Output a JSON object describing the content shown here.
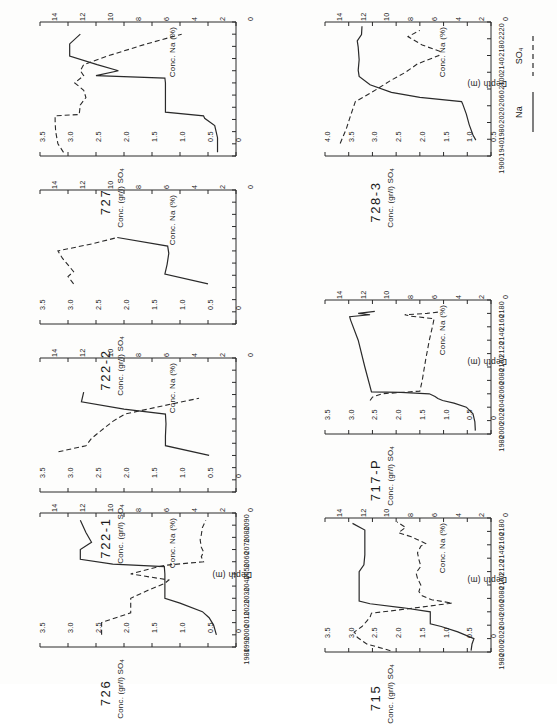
{
  "figure": {
    "orientation": "rotated-90",
    "y_axis_title": "Conc. (gr/l) SO4",
    "y_axis_title_sub": "4",
    "y_axis_title_main": "Conc. (gr/l) SO",
    "y2_axis_title": "Conc. Na (%)",
    "x_axis_title": "Depth (m)"
  },
  "legend": {
    "position": "right-of-728-3",
    "items": [
      {
        "label": "SO4",
        "label_main": "SO",
        "label_sub": "4",
        "style": "dashed",
        "name": "sulphate"
      },
      {
        "label": "Na",
        "label_main": "Na",
        "label_sub": "",
        "style": "solid",
        "name": "sodium"
      }
    ]
  },
  "chart_data": [
    {
      "id": "727",
      "type": "line",
      "title": "727",
      "xlabel": "Depth (m)",
      "ylabel": "Conc. (gr/l) SO4",
      "y2label": "Conc. Na (%)",
      "xlim": [
        1980,
        2090
      ],
      "ylim": [
        0,
        3.5
      ],
      "y2lim": [
        0,
        14
      ],
      "xticks": [
        1980,
        1990,
        2000,
        2010,
        2020,
        2030,
        2040,
        2050,
        2060,
        2070,
        2080,
        2090
      ],
      "xticklabels_shown": false,
      "yticks": [
        0,
        0.5,
        1.0,
        1.5,
        2.0,
        2.5,
        3.0,
        3.5
      ],
      "yticklabels": [
        "0",
        "0.5",
        "1.0",
        "1.5",
        "2.0",
        "2.5",
        "3.0",
        "3.5"
      ],
      "y2ticks": [
        0,
        2,
        4,
        6,
        8,
        10,
        12,
        14
      ],
      "y2ticklabels": [
        "0",
        "2",
        "4",
        "6",
        "8",
        "10",
        "12",
        "14"
      ],
      "grid": false,
      "series": [
        {
          "name": "SO4",
          "style": "dashed",
          "x": [
            1983,
            1990,
            2000,
            2008,
            2013,
            2014,
            2022,
            2028,
            2034,
            2040,
            2046,
            2050,
            2055,
            2062,
            2072,
            2080
          ],
          "y": [
            3.08,
            3.18,
            3.22,
            3.23,
            3.23,
            2.8,
            2.78,
            2.68,
            2.72,
            2.88,
            2.72,
            2.78,
            2.72,
            2.3,
            1.6,
            0.97
          ]
        },
        {
          "name": "Na",
          "style": "solid",
          "x": [
            1983,
            1995,
            2005,
            2011,
            2013,
            2016,
            2040,
            2044,
            2046,
            2050,
            2055,
            2062,
            2072,
            2080
          ],
          "y": [
            0.33,
            0.33,
            0.38,
            0.56,
            0.58,
            1.26,
            1.26,
            1.27,
            2.5,
            2.1,
            2.48,
            2.97,
            2.97,
            2.78
          ]
        }
      ]
    },
    {
      "id": "722-2",
      "type": "line",
      "title": "722-2",
      "xlabel": "Depth (m)",
      "ylabel": "Conc. (gr/l) SO4",
      "y2label": "Conc. Na (%)",
      "xlim": [
        1980,
        2090
      ],
      "ylim": [
        0,
        3.5
      ],
      "y2lim": [
        0,
        14
      ],
      "xticks": [
        1980,
        1990,
        2000,
        2010,
        2020,
        2030,
        2040,
        2050,
        2060,
        2070,
        2080,
        2090
      ],
      "xticklabels_shown": false,
      "yticks": [
        0,
        0.5,
        1.0,
        1.5,
        2.0,
        2.5,
        3.0,
        3.5
      ],
      "yticklabels": [
        "0",
        "0.5",
        "1.0",
        "1.5",
        "2.0",
        "2.5",
        "3.0",
        "3.5"
      ],
      "y2ticks": [
        0,
        2,
        4,
        6,
        8,
        10,
        12,
        14
      ],
      "y2ticklabels": [
        "0",
        "2",
        "4",
        "6",
        "8",
        "10",
        "12",
        "14"
      ],
      "grid": false,
      "series": [
        {
          "name": "SO4",
          "style": "dashed",
          "x": [
            2013,
            2019,
            2023,
            2034,
            2040,
            2046,
            2051
          ],
          "y": [
            2.9,
            3.0,
            2.9,
            3.1,
            3.18,
            2.55,
            2.12
          ]
        },
        {
          "name": "Na",
          "style": "solid",
          "x": [
            2013,
            2021,
            2029,
            2038,
            2044,
            2051
          ],
          "y": [
            0.5,
            1.27,
            1.23,
            1.2,
            1.22,
            2.12
          ]
        }
      ]
    },
    {
      "id": "722-1",
      "type": "line",
      "title": "722-1",
      "xlabel": "Depth (m)",
      "ylabel": "Conc. (gr/l) SO4",
      "y2label": "Conc. Na (%)",
      "xlim": [
        1980,
        2090
      ],
      "ylim": [
        0,
        3.5
      ],
      "y2lim": [
        0,
        14
      ],
      "xticks": [
        1980,
        1990,
        2000,
        2010,
        2020,
        2030,
        2040,
        2050,
        2060,
        2070,
        2080,
        2090
      ],
      "xticklabels_shown": false,
      "yticks": [
        0,
        0.5,
        1.0,
        1.5,
        2.0,
        2.5,
        3.0,
        3.5
      ],
      "yticklabels": [
        "0",
        "0.5",
        "1.0",
        "1.5",
        "2.0",
        "2.5",
        "3.0",
        "3.5"
      ],
      "y2ticks": [
        0,
        2,
        4,
        6,
        8,
        10,
        12,
        14
      ],
      "y2ticklabels": [
        "0",
        "2",
        "4",
        "6",
        "8",
        "10",
        "12",
        "14"
      ],
      "grid": false,
      "series": [
        {
          "name": "SO4",
          "style": "dashed",
          "x": [
            2013,
            2018,
            2024,
            2030,
            2038,
            2044,
            2050,
            2057
          ],
          "y": [
            3.17,
            2.68,
            2.58,
            2.42,
            2.2,
            1.98,
            1.38,
            0.66
          ]
        },
        {
          "name": "Na",
          "style": "solid",
          "x": [
            2010,
            2018,
            2026,
            2036,
            2044,
            2048,
            2054,
            2062
          ],
          "y": [
            0.48,
            1.26,
            1.26,
            1.25,
            1.26,
            2.0,
            2.76,
            2.72
          ]
        }
      ]
    },
    {
      "id": "726",
      "type": "line",
      "title": "726",
      "xlabel": "Depth (m)",
      "ylabel": "Conc. (gr/l) SO4",
      "y2label": "Conc. Na (%)",
      "xlim": [
        1980,
        2090
      ],
      "ylim": [
        0,
        3.5
      ],
      "y2lim": [
        0,
        14
      ],
      "xticks": [
        1980,
        1990,
        2000,
        2010,
        2020,
        2030,
        2040,
        2050,
        2060,
        2070,
        2080,
        2090
      ],
      "xticklabels": [
        "1980",
        "1990",
        "2000",
        "2010",
        "2020",
        "2030",
        "2040",
        "2050",
        "2060",
        "2070",
        "2080",
        "2090"
      ],
      "xticklabels_shown": true,
      "yticks": [
        0,
        0.5,
        1.0,
        1.5,
        2.0,
        2.5,
        3.0,
        3.5
      ],
      "yticklabels": [
        "0",
        "0.5",
        "1.0",
        "1.5",
        "2.0",
        "2.5",
        "3.0",
        "3.5"
      ],
      "y2ticks": [
        0,
        2,
        4,
        6,
        8,
        10,
        12,
        14
      ],
      "y2ticklabels": [
        "0",
        "2",
        "4",
        "6",
        "8",
        "10",
        "12",
        "14"
      ],
      "grid": false,
      "series": [
        {
          "name": "SO4",
          "style": "dashed",
          "x": [
            1990,
            2000,
            2002,
            2008,
            2012,
            2020,
            2026,
            2032,
            2035,
            2040,
            2044,
            2047,
            2050,
            2054,
            2058,
            2062,
            2068,
            2072,
            2078,
            2084
          ],
          "y": [
            2.4,
            2.4,
            2.28,
            1.88,
            1.88,
            1.88,
            1.6,
            1.28,
            1.2,
            1.88,
            1.55,
            1.28,
            0.58,
            0.62,
            0.58,
            0.62,
            0.64,
            0.62,
            0.6,
            0.54
          ]
        },
        {
          "name": "Na",
          "style": "solid",
          "x": [
            1990,
            1998,
            2004,
            2009,
            2016,
            2020,
            2030,
            2040,
            2046,
            2048,
            2052,
            2060,
            2066,
            2074,
            2084
          ],
          "y": [
            0.35,
            0.4,
            0.48,
            0.6,
            1.0,
            1.27,
            1.27,
            1.27,
            1.28,
            2.2,
            2.78,
            2.78,
            2.58,
            2.68,
            2.78
          ]
        }
      ]
    },
    {
      "id": "728-3",
      "type": "line",
      "title": "728-3",
      "xlabel": "Depth (m)",
      "ylabel": "Conc. (gr/l) SO4",
      "y2label": "Conc. Na (%)",
      "xlim": [
        1900,
        2220
      ],
      "ylim": [
        0.5,
        4.0
      ],
      "y2lim": [
        0,
        14
      ],
      "xticks": [
        1900,
        1940,
        1980,
        2020,
        2060,
        2100,
        2140,
        2180,
        2220
      ],
      "xticklabels": [
        "1900",
        "1940",
        "1980",
        "2020",
        "2060",
        "2100",
        "2140",
        "2180",
        "2220"
      ],
      "xticklabels_shown": true,
      "yticks": [
        0.5,
        1.0,
        1.5,
        2.0,
        2.5,
        3.0,
        3.5,
        4.0
      ],
      "yticklabels": [
        "0.5",
        "1.0",
        "1.5",
        "2.0",
        "2.5",
        "3.0",
        "3.5",
        "4.0"
      ],
      "y2ticks": [
        0,
        2,
        4,
        6,
        8,
        10,
        12,
        14
      ],
      "y2ticklabels": [
        "0",
        "2",
        "4",
        "6",
        "8",
        "10",
        "12",
        "14"
      ],
      "grid": false,
      "series": [
        {
          "name": "SO4",
          "style": "dashed",
          "x": [
            1930,
            1965,
            1990,
            2010,
            2030,
            2040,
            2060,
            2080,
            2100,
            2120,
            2140,
            2150,
            2165,
            2185,
            2200
          ],
          "y": [
            3.68,
            3.55,
            3.48,
            3.42,
            3.36,
            3.2,
            2.9,
            2.62,
            2.3,
            2.05,
            1.6,
            1.58,
            1.95,
            2.25,
            2.0
          ]
        },
        {
          "name": "Na",
          "style": "solid",
          "x": [
            1938,
            1950,
            1975,
            2000,
            2025,
            2030,
            2040,
            2052,
            2070,
            2090,
            2105,
            2130,
            2160,
            2175,
            2190,
            2210
          ],
          "y": [
            0.82,
            0.88,
            0.96,
            1.02,
            1.1,
            1.12,
            2.0,
            2.6,
            3.05,
            3.28,
            3.3,
            3.28,
            3.3,
            3.32,
            3.23,
            3.22
          ]
        }
      ]
    },
    {
      "id": "717-P",
      "type": "line",
      "title": "717-P",
      "xlabel": "Depth (m)",
      "ylabel": "Conc. (gr/l) SO4",
      "y2label": "Conc. Na (%)",
      "xlim": [
        1980,
        2180
      ],
      "ylim": [
        0,
        3.5
      ],
      "y2lim": [
        0,
        14
      ],
      "xticks": [
        1980,
        2000,
        2020,
        2040,
        2060,
        2080,
        2100,
        2120,
        2140,
        2160,
        2180
      ],
      "xticklabels": [
        "1980",
        "2000",
        "2020",
        "2040",
        "2060",
        "2080",
        "2100",
        "2120",
        "2140",
        "2160",
        "2180"
      ],
      "xticklabels_shown": true,
      "yticks": [
        0,
        0.5,
        1.0,
        1.5,
        2.0,
        2.5,
        3.0,
        3.5
      ],
      "yticklabels": [
        "0",
        "0.5",
        "1.0",
        "1.5",
        "2.0",
        "2.5",
        "3.0",
        "3.5"
      ],
      "y2ticks": [
        0,
        2,
        4,
        6,
        8,
        10,
        12,
        14
      ],
      "y2ticklabels": [
        "0",
        "2",
        "4",
        "6",
        "8",
        "10",
        "12",
        "14"
      ],
      "grid": false,
      "series": [
        {
          "name": "SO4",
          "style": "dashed",
          "x": [
            2030,
            2035,
            2040,
            2042,
            2043,
            2044,
            2060,
            2090,
            2120,
            2145,
            2152,
            2156,
            2158,
            2160,
            2162
          ],
          "y": [
            2.55,
            2.5,
            2.3,
            1.9,
            1.7,
            1.5,
            1.45,
            1.38,
            1.3,
            1.22,
            1.2,
            1.7,
            1.82,
            1.35,
            1.1
          ]
        },
        {
          "name": "Na",
          "style": "solid",
          "x": [
            1985,
            1998,
            2010,
            2020,
            2026,
            2030,
            2033,
            2036,
            2040,
            2042,
            2043,
            2080,
            2120,
            2150,
            2155,
            2158,
            2160,
            2163
          ],
          "y": [
            0.33,
            0.34,
            0.38,
            0.52,
            0.78,
            1.02,
            1.12,
            1.18,
            1.3,
            1.9,
            2.52,
            2.66,
            2.8,
            2.96,
            2.98,
            2.55,
            2.8,
            2.45
          ]
        }
      ]
    },
    {
      "id": "715",
      "type": "line",
      "title": "715",
      "xlabel": "Depth (m)",
      "ylabel": "Conc. (gr/l) SO4",
      "y2label": "Conc. Na (%)",
      "xlim": [
        1980,
        2180
      ],
      "ylim": [
        0,
        3.5
      ],
      "y2lim": [
        0,
        14
      ],
      "xticks": [
        1980,
        2000,
        2020,
        2040,
        2060,
        2080,
        2100,
        2120,
        2140,
        2160,
        2180
      ],
      "xticklabels": [
        "1980",
        "2000",
        "2020",
        "2040",
        "2060",
        "2080",
        "2100",
        "2120",
        "2140",
        "2160",
        "2180"
      ],
      "xticklabels_shown": true,
      "yticks": [
        0,
        0.5,
        1.0,
        1.5,
        2.0,
        2.5,
        3.0,
        3.5
      ],
      "yticklabels": [
        "0",
        "0.5",
        "1.0",
        "1.5",
        "2.0",
        "2.5",
        "3.0",
        "3.5"
      ],
      "y2ticks": [
        0,
        2,
        4,
        6,
        8,
        10,
        12,
        14
      ],
      "y2ticklabels": [
        "0",
        "2",
        "4",
        "6",
        "8",
        "10",
        "12",
        "14"
      ],
      "grid": false,
      "series": [
        {
          "name": "SO4",
          "style": "dashed",
          "x": [
            1982,
            1992,
            2002,
            2010,
            2018,
            2026,
            2032,
            2038,
            2044,
            2050,
            2053,
            2058,
            2064,
            2070,
            2080,
            2090,
            2098,
            2108,
            2118,
            2128,
            2138,
            2142,
            2152,
            2158,
            2166,
            2174
          ],
          "y": [
            2.12,
            2.62,
            2.82,
            2.88,
            2.72,
            2.62,
            2.55,
            2.52,
            1.8,
            1.15,
            0.82,
            1.25,
            1.45,
            1.52,
            1.48,
            1.55,
            1.58,
            1.48,
            1.52,
            1.55,
            1.48,
            1.38,
            1.68,
            1.95,
            1.8,
            1.98
          ]
        },
        {
          "name": "Na",
          "style": "solid",
          "x": [
            1982,
            1992,
            2000,
            2010,
            2018,
            2022,
            2032,
            2040,
            2046,
            2052,
            2056,
            2062,
            2080,
            2100,
            2110,
            2125,
            2140,
            2152,
            2162,
            2172
          ],
          "y": [
            0.42,
            0.4,
            0.36,
            0.7,
            1.05,
            1.28,
            1.28,
            1.28,
            1.85,
            2.55,
            2.78,
            2.78,
            2.78,
            2.78,
            2.68,
            2.66,
            2.66,
            2.66,
            2.66,
            2.92
          ]
        }
      ]
    }
  ]
}
